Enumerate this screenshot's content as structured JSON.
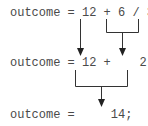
{
  "diagram": {
    "title": "",
    "steps": [
      {
        "label": "outcome = 12 + 6 / 3;"
      },
      {
        "label": "outcome = 12 +    2;"
      },
      {
        "label": "outcome =     14;"
      }
    ],
    "connectors": [
      {
        "from": "12 (step 1)",
        "to": "12 (step 2)",
        "type": "arrow"
      },
      {
        "from": "6 / 3 (step 1)",
        "to": "2 (step 2)",
        "type": "bracket-arrow"
      },
      {
        "from": "12 + 2 (step 2)",
        "to": "14 (step 3)",
        "type": "bracket-arrow"
      }
    ],
    "colors": {
      "text": "#4a4a4a",
      "lines": "#333333",
      "background": "#ffffff"
    }
  }
}
